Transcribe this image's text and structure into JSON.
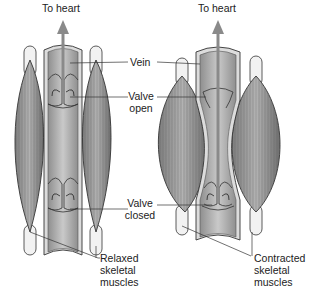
{
  "figure": {
    "panels": [
      {
        "name": "relaxed",
        "top_label": "To heart",
        "bottom_label_lines": [
          "Relaxed",
          "skeletal",
          "muscles"
        ]
      },
      {
        "name": "contracted",
        "top_label": "To heart",
        "bottom_label_lines": [
          "Contracted",
          "skeletal",
          "muscles"
        ]
      }
    ],
    "center_labels": {
      "vein": "Vein",
      "valve_open_lines": [
        "Valve",
        "open"
      ],
      "valve_closed_lines": [
        "Valve",
        "closed"
      ]
    },
    "colors": {
      "outline": "#333333",
      "vein_fill": "#a9a9a9",
      "vein_wall": "#d8d8d8",
      "muscle_fill": "#9a9a9a",
      "tendon": "#f2f2f2",
      "arrow": "#8a8a8a",
      "text": "#222222"
    }
  }
}
